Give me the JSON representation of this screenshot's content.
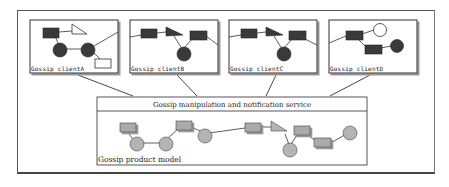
{
  "diagram": {
    "clients": [
      {
        "label": "Gossip clientA"
      },
      {
        "label": "Gossip clientB"
      },
      {
        "label": "Gossip clientC"
      },
      {
        "label": "Gossip clientD"
      }
    ],
    "service": {
      "label": "Gossip manipulation and notification service"
    },
    "model": {
      "label": "Gossip product model"
    }
  }
}
